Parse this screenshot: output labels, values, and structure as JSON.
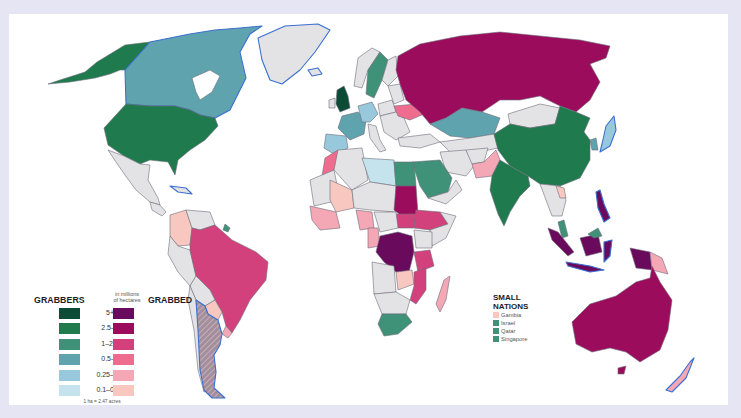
{
  "map": {
    "background": "#e6e5f4",
    "panel_color": "#ffffff",
    "no_data_color": "#e3e3e6",
    "coast_color": "#3b6fd0"
  },
  "legend": {
    "left_title": "GRABBERS",
    "unit_line1": "in millions",
    "unit_line2": "of hectares",
    "right_title": "GRABBED",
    "rows": [
      {
        "label": "5+",
        "grabber": "#0c4c36",
        "grabbed": "#6a0a5c"
      },
      {
        "label": "2.5–5",
        "grabber": "#1f7a4e",
        "grabbed": "#9c0c5c"
      },
      {
        "label": "1–2.5",
        "grabber": "#3f9278",
        "grabbed": "#d3417c"
      },
      {
        "label": "0.5–1",
        "grabber": "#5ea3ad",
        "grabbed": "#ee6d8f"
      },
      {
        "label": "0.25–0.5",
        "grabber": "#97c8dc",
        "grabbed": "#f4a7b5"
      },
      {
        "label": "0.1–0.25",
        "grabber": "#c5e3ec",
        "grabbed": "#f8c8c0"
      }
    ],
    "note": "1 ha = 2.47 acres"
  },
  "small_nations": {
    "title_line1": "SMALL",
    "title_line2": "NATIONS",
    "items": [
      {
        "name": "Gambia",
        "color": "#f8c8c0"
      },
      {
        "name": "Israel",
        "color": "#3f9278"
      },
      {
        "name": "Qatar",
        "color": "#3f9278"
      },
      {
        "name": "Singapore",
        "color": "#3f9278"
      }
    ]
  },
  "countries": [
    {
      "name": "United States",
      "role": "grabber",
      "band": "2.5–5"
    },
    {
      "name": "Alaska (US)",
      "role": "grabber",
      "band": "2.5–5"
    },
    {
      "name": "Canada",
      "role": "grabber",
      "band": "0.5–1"
    },
    {
      "name": "United Kingdom",
      "role": "grabber",
      "band": "5+"
    },
    {
      "name": "Sweden",
      "role": "grabber",
      "band": "1–2.5"
    },
    {
      "name": "France",
      "role": "grabber",
      "band": "0.5–1"
    },
    {
      "name": "Germany",
      "role": "grabber",
      "band": "0.25–0.5"
    },
    {
      "name": "Spain",
      "role": "grabber",
      "band": "0.25–0.5"
    },
    {
      "name": "Libya",
      "role": "grabber",
      "band": "0.1–0.25"
    },
    {
      "name": "Egypt",
      "role": "grabber",
      "band": "1–2.5"
    },
    {
      "name": "Saudi Arabia",
      "role": "grabber",
      "band": "1–2.5"
    },
    {
      "name": "Kazakhstan",
      "role": "grabber",
      "band": "0.5–1"
    },
    {
      "name": "China",
      "role": "grabber",
      "band": "2.5–5"
    },
    {
      "name": "India",
      "role": "grabber",
      "band": "2.5–5"
    },
    {
      "name": "South Korea",
      "role": "grabber",
      "band": "0.5–1"
    },
    {
      "name": "Japan",
      "role": "grabber",
      "band": "0.25–0.5"
    },
    {
      "name": "South Africa",
      "role": "grabber",
      "band": "1–2.5"
    },
    {
      "name": "Malaysia",
      "role": "grabber",
      "band": "1–2.5"
    },
    {
      "name": "Guyana",
      "role": "grabber",
      "band": "1–2.5"
    },
    {
      "name": "Russia",
      "role": "grabbed",
      "band": "2.5–5"
    },
    {
      "name": "Ukraine",
      "role": "grabbed",
      "band": "0.5–1"
    },
    {
      "name": "Pakistan",
      "role": "grabbed",
      "band": "0.25–0.5"
    },
    {
      "name": "Laos",
      "role": "grabbed",
      "band": "0.1–0.25"
    },
    {
      "name": "Philippines",
      "role": "grabbed",
      "band": "5+"
    },
    {
      "name": "Indonesia",
      "role": "grabbed",
      "band": "5+"
    },
    {
      "name": "Papua New Guinea",
      "role": "grabbed",
      "band": "0.25–0.5"
    },
    {
      "name": "Australia",
      "role": "grabbed",
      "band": "2.5–5"
    },
    {
      "name": "New Zealand",
      "role": "grabbed",
      "band": "0.25–0.5"
    },
    {
      "name": "Morocco",
      "role": "grabbed",
      "band": "0.5–1"
    },
    {
      "name": "Mali",
      "role": "grabbed",
      "band": "0.1–0.25"
    },
    {
      "name": "Sudan",
      "role": "grabbed",
      "band": "2.5–5"
    },
    {
      "name": "South Sudan",
      "role": "grabbed",
      "band": "1–2.5"
    },
    {
      "name": "Ethiopia",
      "role": "grabbed",
      "band": "1–2.5"
    },
    {
      "name": "DR Congo",
      "role": "grabbed",
      "band": "5+"
    },
    {
      "name": "Tanzania",
      "role": "grabbed",
      "band": "1–2.5"
    },
    {
      "name": "Mozambique",
      "role": "grabbed",
      "band": "1–2.5"
    },
    {
      "name": "Zambia",
      "role": "grabbed",
      "band": "0.1–0.25"
    },
    {
      "name": "Madagascar",
      "role": "grabbed",
      "band": "0.25–0.5"
    },
    {
      "name": "Nigeria",
      "role": "grabbed",
      "band": "0.25–0.5"
    },
    {
      "name": "Cameroon",
      "role": "grabbed",
      "band": "0.25–0.5"
    },
    {
      "name": "Liberia",
      "role": "grabbed",
      "band": "0.5–1"
    },
    {
      "name": "Brazil",
      "role": "grabbed",
      "band": "1–2.5"
    },
    {
      "name": "Colombia",
      "role": "grabbed",
      "band": "0.1–0.25"
    },
    {
      "name": "Paraguay",
      "role": "grabbed",
      "band": "0.1–0.25"
    },
    {
      "name": "Uruguay",
      "role": "grabbed",
      "band": "0.25–0.5"
    },
    {
      "name": "Argentina",
      "role": "both",
      "band": "hatched"
    }
  ]
}
